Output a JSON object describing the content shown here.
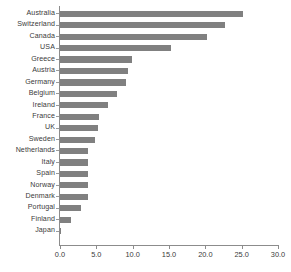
{
  "chart_data": {
    "type": "bar",
    "orientation": "horizontal",
    "title": "",
    "subtitle": "",
    "xlabel": "",
    "ylabel": "",
    "categories": [
      "Australia",
      "Switzerland",
      "Canada",
      "USA",
      "Greece",
      "Austria",
      "Germany",
      "Belgium",
      "Ireland",
      "France",
      "UK",
      "Sweden",
      "Netherlands",
      "Italy",
      "Spain",
      "Norway",
      "Denmark",
      "Portugal",
      "Finland",
      "Japan"
    ],
    "values": [
      25.2,
      22.7,
      20.2,
      15.3,
      9.9,
      9.4,
      9.1,
      7.8,
      6.6,
      5.4,
      5.2,
      4.8,
      3.9,
      3.9,
      3.9,
      3.8,
      3.8,
      2.9,
      1.5,
      0.2
    ],
    "xlim": [
      0,
      30
    ],
    "xticks": [
      0,
      5,
      10,
      15,
      20,
      25,
      30
    ],
    "xtick_labels": [
      "0.0",
      "5.0",
      "10.0",
      "15.0",
      "20.0",
      "25.0",
      "30.0"
    ],
    "grid": false,
    "legend": false,
    "bar_color": "#808080",
    "axis_color": "#8c8c8c",
    "text_color": "#3a3a3a",
    "background_color": "#ffffff"
  }
}
